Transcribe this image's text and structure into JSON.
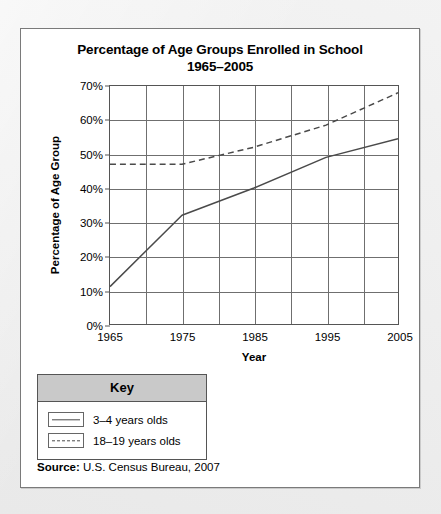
{
  "figure": {
    "title_line1": "Percentage of Age Groups Enrolled in School",
    "title_line2": "1965–2005",
    "source_label": "Source:",
    "source_text": "U.S. Census Bureau, 2007"
  },
  "key": {
    "header": "Key",
    "entries": [
      {
        "label": "3–4 years olds",
        "style": "solid"
      },
      {
        "label": "18–19 years olds",
        "style": "dashed"
      }
    ]
  },
  "chart_data": {
    "type": "line",
    "title": "Percentage of Age Groups Enrolled in School 1965–2005",
    "xlabel": "Year",
    "ylabel": "Percentage of Age Group",
    "x": [
      1965,
      1975,
      1985,
      1995,
      2005
    ],
    "xlim": [
      1965,
      2005
    ],
    "ylim": [
      0,
      70
    ],
    "xticks": [
      "1965",
      "1975",
      "1985",
      "1995",
      "2005"
    ],
    "yticks": [
      "0%",
      "10%",
      "20%",
      "30%",
      "40%",
      "50%",
      "60%",
      "70%"
    ],
    "x_gridline_years": [
      1965,
      1970,
      1975,
      1980,
      1985,
      1990,
      1995,
      2000,
      2005
    ],
    "grid": true,
    "legend_position": "below-left",
    "series": [
      {
        "name": "3–4 years olds",
        "style": "solid",
        "color": "#4a4a4a",
        "values": [
          11,
          32,
          40,
          49,
          54.5
        ]
      },
      {
        "name": "18–19 years olds",
        "style": "dashed",
        "color": "#4a4a4a",
        "values": [
          47,
          47,
          52,
          58.5,
          68
        ]
      }
    ]
  },
  "colors": {
    "page_background": "#ebebeb",
    "card_background": "#ffffff",
    "frame": "#555555",
    "gridline": "#6f6f6f",
    "key_header": "#c9c9c9",
    "line": "#4a4a4a"
  }
}
